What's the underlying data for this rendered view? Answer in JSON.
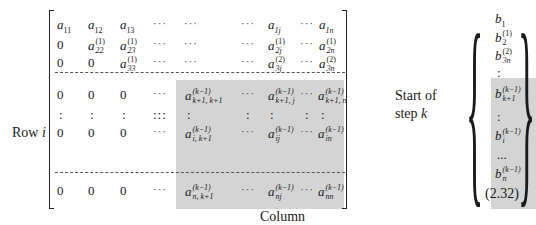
{
  "equation_number": "(2.32)",
  "labels": {
    "row": "Row",
    "row_var": "i",
    "column": "Column",
    "column_var": "j",
    "start_of": "Start of",
    "step": "step",
    "step_var": "k"
  },
  "matrix": {
    "upper_rows": [
      [
        "a_11",
        "a_12",
        "a_13",
        "···",
        "···",
        "···",
        "a_1j",
        "···",
        "a_1n"
      ],
      [
        "0",
        "a_22^(1)",
        "a_23^(1)",
        "···",
        "···",
        "···",
        "a_2j^(1)",
        "···",
        "a_2n^(1)"
      ],
      [
        "0",
        "0",
        "a_33^(1)",
        "···",
        "···",
        "···",
        "a_3j^(2)",
        "···",
        "a_3n^(2)"
      ]
    ],
    "lower_rows": [
      [
        "0",
        "0",
        "0",
        "···",
        "a_{k+1,k+1}^(k-1)",
        "···",
        "a_{k+1,j}^(k-1)",
        "···",
        "a_{k+1,n}^(k-1)"
      ],
      [
        ":",
        ":",
        ":",
        ":::",
        ":",
        ":",
        ":",
        ":",
        ":"
      ],
      [
        "0",
        "0",
        "0",
        "···",
        "a_{i,k+1}^(k-1)",
        "···",
        "a_ij^(k-1)",
        "···",
        "a_in^(k-1)"
      ],
      [
        "0",
        "0",
        "0",
        "···",
        "a_{n,k+1}^(k-1)",
        "···",
        "a_nj^(k-1)",
        "···",
        "a_nn^(k-1)"
      ]
    ]
  },
  "vector_b": [
    "b_1",
    "b_2^(1)",
    "b_3n^(2)",
    ":",
    "b_{k+1}^(k-1)",
    ":",
    "b_i^(k-1)",
    "...",
    "b_n^(k-1)"
  ],
  "cells": {
    "a": "a",
    "b": "b",
    "zero": "0",
    "hdots": "···",
    "vdots": ":",
    "ddots": ":::",
    "bdots": "...",
    "s11": "11",
    "s12": "12",
    "s13": "13",
    "s1j": "1j",
    "s1n": "1n",
    "s22": "22",
    "s23": "23",
    "s2j": "2j",
    "s2n": "2n",
    "s33": "33",
    "s3j": "3j",
    "s3n": "3n",
    "sk1k1": "k+1, k+1",
    "sk1j": "k+1, j",
    "sk1n": "k+1, n",
    "sik1": "i, k+1",
    "sij": "ij",
    "sin": "in",
    "snk1": "n, k+1",
    "snj": "nj",
    "snn": "nn",
    "p1": "(1)",
    "p2": "(2)",
    "pk": "(k−1)",
    "b1": "1",
    "b2": "2",
    "b3": "3n",
    "bk1": "k+1",
    "bi": "i",
    "bn": "n"
  },
  "colors": {
    "shade": "#d4d4d4",
    "text": "#1a1a1a"
  }
}
